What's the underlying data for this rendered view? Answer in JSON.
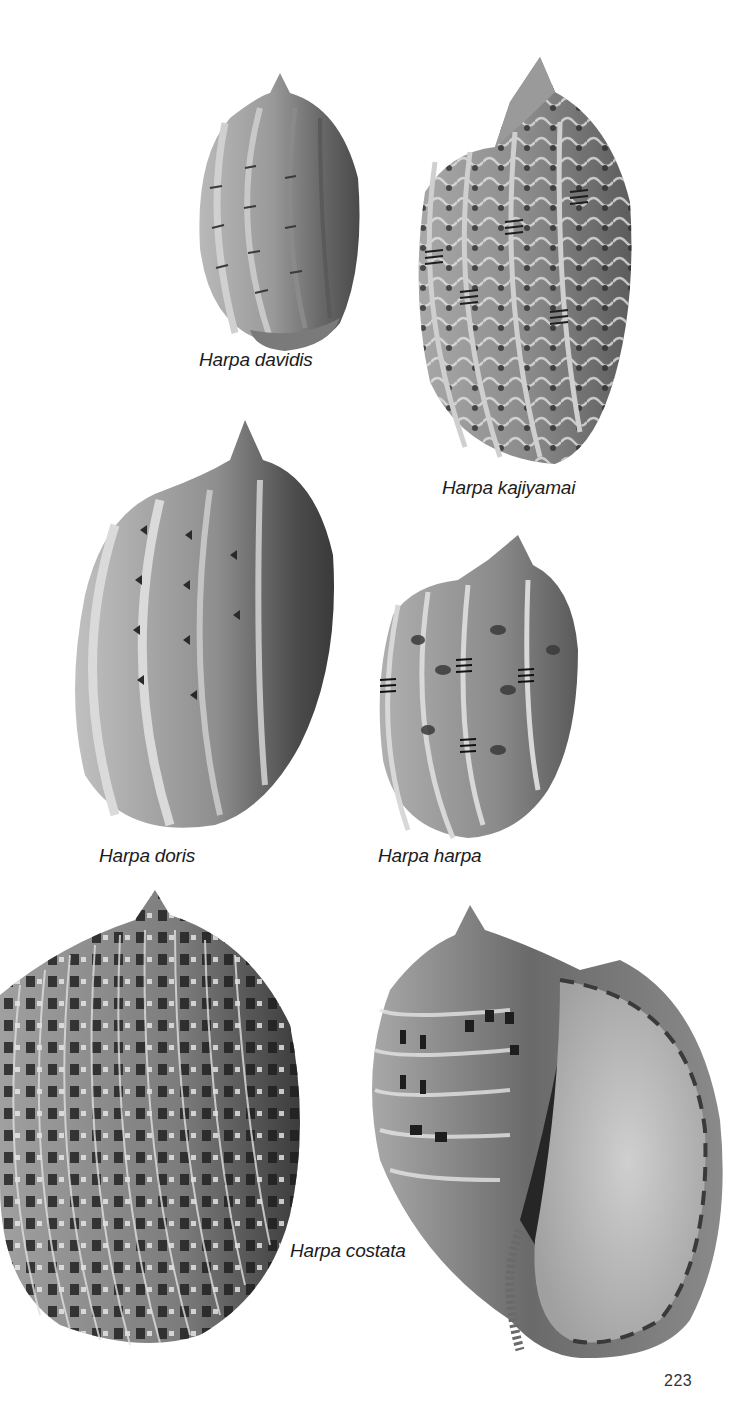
{
  "page": {
    "type": "illustrated plate",
    "page_number": "223",
    "background": "#ffffff",
    "ink_color": "#1c1c1c"
  },
  "specimens": [
    {
      "id": "davidis",
      "caption": "Harpa davidis",
      "pattern": "sparse dashes on ribs",
      "tone": "#8a8a8a"
    },
    {
      "id": "kajiyamai",
      "caption": "Harpa kajiyamai",
      "pattern": "wavy zigzag bands with triple-bar rib markings",
      "tone": "#7a7a7a"
    },
    {
      "id": "doris",
      "caption": "Harpa doris",
      "pattern": "chevron marks between pale ribs",
      "tone": "#858585"
    },
    {
      "id": "harpa",
      "caption": "Harpa harpa",
      "pattern": "dark blotches with triple-bar rib markings",
      "tone": "#7c7c7c"
    },
    {
      "id": "costata",
      "caption": "Harpa costata",
      "pattern": "dense ribs with checkered dark squares",
      "views": [
        "dorsal",
        "apertural"
      ],
      "tone": "#6e6e6e"
    }
  ]
}
